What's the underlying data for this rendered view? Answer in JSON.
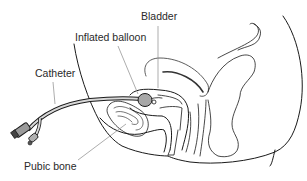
{
  "figure": {
    "labels": {
      "bladder": "Bladder",
      "balloon": "Inflated balloon",
      "catheter": "Catheter",
      "pubic_bone": "Pubic bone"
    },
    "colors": {
      "line": "#1a1a1a",
      "leader": "#8a8a8a",
      "balloon_fill": "#a8a8a8",
      "catheter_fill": "#c8c8c8",
      "background": "#ffffff"
    }
  }
}
